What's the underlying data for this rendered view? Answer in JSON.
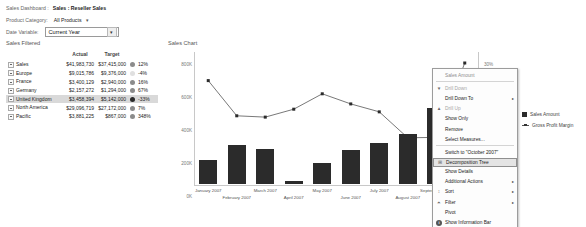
{
  "header": {
    "breadcrumb_label": "Sales Dashboard :",
    "breadcrumb_value": "Sales : Reseller Sales",
    "category_label": "Product Category:",
    "category_value": "All Products",
    "category_caret": "▾",
    "date_label": "Date Variable:",
    "date_value": "Current Year",
    "date_arrow": "▾"
  },
  "left_panel": {
    "title": "Sales Filtered",
    "columns": [
      "",
      "Actual",
      "Target",
      ""
    ],
    "rows": [
      {
        "name": "Sales",
        "level": 1,
        "actual": "$41,983,730",
        "target": "$37,415,000",
        "pct": "12%",
        "status": "#8c8c8c",
        "highlight": false
      },
      {
        "name": "Europe",
        "level": 2,
        "actual": "$9,015,786",
        "target": "$9,376,000",
        "pct": "-4%",
        "status": "#e0e0e0",
        "highlight": false
      },
      {
        "name": "France",
        "level": 3,
        "actual": "$3,400,129",
        "target": "$2,940,000",
        "pct": "16%",
        "status": "#8c8c8c",
        "highlight": false
      },
      {
        "name": "Germany",
        "level": 3,
        "actual": "$2,157,272",
        "target": "$1,294,000",
        "pct": "67%",
        "status": "#8c8c8c",
        "highlight": false
      },
      {
        "name": "United Kingdom",
        "level": 3,
        "actual": "$3,458,394",
        "target": "$5,142,000",
        "pct": "-33%",
        "status": "#2b2b2b",
        "highlight": true
      },
      {
        "name": "North America",
        "level": 2,
        "actual": "$29,096,719",
        "target": "$27,172,000",
        "pct": "7%",
        "status": "#8c8c8c",
        "highlight": false
      },
      {
        "name": "Pacific",
        "level": 2,
        "actual": "$3,881,225",
        "target": "$867,000",
        "pct": "348%",
        "status": "#8c8c8c",
        "highlight": false
      }
    ]
  },
  "chart_data": {
    "type": "bar",
    "title": "Sales Chart",
    "xlabel": "",
    "ylabel": "",
    "ylim": [
      0,
      800000
    ],
    "y2lim": [
      0,
      30
    ],
    "grid": false,
    "legend_position": "right",
    "categories": [
      "January 2007",
      "February 2007",
      "March 2007",
      "April 2007",
      "May 2007",
      "June 2007",
      "July 2007",
      "August 2007",
      "September 2007",
      "October 2007"
    ],
    "y_ticks": [
      "0K",
      "200K",
      "400K",
      "600K",
      "800K"
    ],
    "y_tick_values": [
      0,
      200000,
      400000,
      600000,
      800000
    ],
    "y2_ticks": [
      "0%",
      "5%",
      "10%",
      "15%",
      "20%",
      "25%",
      "30%"
    ],
    "y2_tick_values": [
      0,
      5,
      10,
      15,
      20,
      25,
      30
    ],
    "series": [
      {
        "name": "Sales Amount",
        "type": "bar",
        "axis": "left",
        "color": "#2b2b2b",
        "values": [
          145000,
          235000,
          215000,
          20000,
          130000,
          205000,
          250000,
          305000,
          460000,
          180000
        ]
      },
      {
        "name": "Gross Profit Margin",
        "type": "line",
        "axis": "right",
        "color": "#555555",
        "values": [
          23.5,
          15.5,
          15.2,
          17.0,
          20.5,
          18.2,
          16.4,
          10.5,
          10.6,
          27.5
        ]
      }
    ]
  },
  "legend": {
    "items": [
      {
        "label": "Sales Amount",
        "marker": "square-swatch"
      },
      {
        "label": "Gross Profit Margin",
        "marker": "line-swatch"
      }
    ]
  },
  "context_menu": {
    "items": [
      {
        "label": "Sales Amount",
        "state": "header",
        "icon": "",
        "submenu": false
      },
      {
        "label": "Drill Down",
        "state": "disabled",
        "icon": "drill-down-icon",
        "submenu": false
      },
      {
        "label": "Drill Down To",
        "state": "normal",
        "icon": "",
        "submenu": true
      },
      {
        "label": "Drill Up",
        "state": "disabled",
        "icon": "drill-up-icon",
        "submenu": false
      },
      {
        "label": "Show Only",
        "state": "normal",
        "icon": "",
        "submenu": false
      },
      {
        "label": "Remove",
        "state": "normal",
        "icon": "",
        "submenu": false
      },
      {
        "label": "Select Measures...",
        "state": "normal",
        "icon": "",
        "submenu": false
      },
      {
        "label": "Switch to \"October 2007\"",
        "state": "normal",
        "icon": "",
        "submenu": false
      },
      {
        "label": "Decomposition Tree",
        "state": "selected",
        "icon": "tree-icon",
        "submenu": false
      },
      {
        "label": "Show Details",
        "state": "normal",
        "icon": "",
        "submenu": false
      },
      {
        "label": "Additional Actions",
        "state": "normal",
        "icon": "",
        "submenu": true
      },
      {
        "label": "Sort",
        "state": "normal",
        "icon": "sort-icon",
        "submenu": true
      },
      {
        "label": "Filter",
        "state": "normal",
        "icon": "filter-icon",
        "submenu": true
      },
      {
        "label": "Pivot",
        "state": "normal",
        "icon": "",
        "submenu": false
      },
      {
        "label": "Show Information Bar",
        "state": "normal",
        "icon": "info-icon",
        "submenu": false
      }
    ],
    "submenu_glyph": "▸"
  }
}
